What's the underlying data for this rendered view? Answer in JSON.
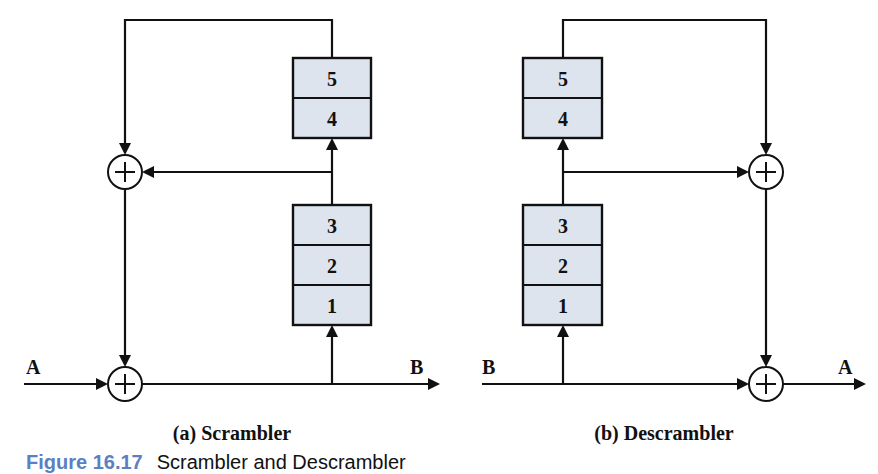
{
  "diagram": {
    "scrambler": {
      "caption": "(a) Scrambler",
      "input_label": "A",
      "output_label": "B",
      "registers_upper": [
        "5",
        "4"
      ],
      "registers_lower": [
        "3",
        "2",
        "1"
      ]
    },
    "descrambler": {
      "caption": "(b) Descrambler",
      "input_label": "B",
      "output_label": "A",
      "registers_upper": [
        "5",
        "4"
      ],
      "registers_lower": [
        "3",
        "2",
        "1"
      ]
    },
    "xor_symbol": "xor-plus-circle",
    "colors": {
      "register_fill": "#dde4ee",
      "line": "#111111",
      "figure_number": "#5b7fc4"
    }
  },
  "figure": {
    "number": "Figure 16.17",
    "title": "Scrambler and Descrambler"
  }
}
